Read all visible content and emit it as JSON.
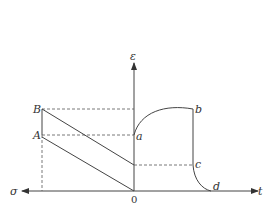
{
  "diagram": {
    "axes": {
      "vertical_label": "ε",
      "horizontal_right_label": "t",
      "horizontal_left_label": "σ",
      "origin_label": "0"
    },
    "points": {
      "A": "A",
      "B": "B",
      "a": "a",
      "b": "b",
      "c": "c",
      "d": "d"
    },
    "colors": {
      "line": "#444444",
      "dashed": "#555555"
    }
  }
}
